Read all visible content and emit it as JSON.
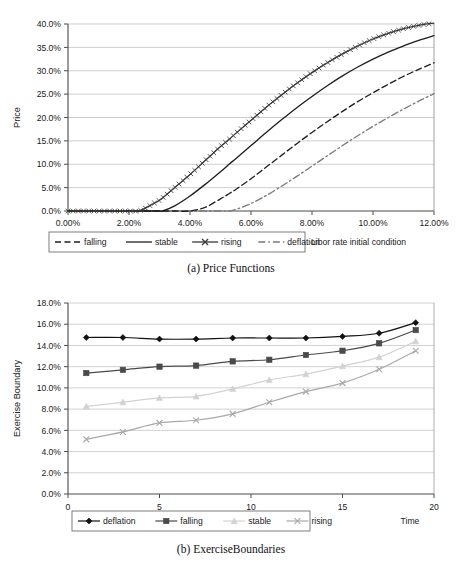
{
  "figures": [
    {
      "id": "price-functions",
      "caption": "(a) Price Functions",
      "outside_label": "Libor rate initial condition",
      "chart_data": {
        "type": "line",
        "title": "",
        "xlabel": "Libor rate initial condition",
        "ylabel": "Price",
        "xlim": [
          0,
          12
        ],
        "ylim": [
          0,
          40
        ],
        "xticks": [
          "0.00%",
          "2.00%",
          "4.00%",
          "6.00%",
          "8.00%",
          "10.00%",
          "12.00%"
        ],
        "xtick_values": [
          0,
          2,
          4,
          6,
          8,
          10,
          12
        ],
        "yticks": [
          "0.0%",
          "5.0%",
          "10.0%",
          "15.0%",
          "20.0%",
          "25.0%",
          "30.0%",
          "35.0%",
          "40.0%"
        ],
        "ytick_values": [
          0,
          5,
          10,
          15,
          20,
          25,
          30,
          35,
          40
        ],
        "grid": true,
        "legend_position": "bottom",
        "x": [
          0,
          0.5,
          1,
          1.5,
          2,
          2.3,
          2.5,
          3,
          3.1,
          3.5,
          4,
          4.5,
          5,
          5.3,
          5.5,
          6,
          6.5,
          7,
          7.5,
          8,
          8.5,
          9,
          9.5,
          10,
          10.5,
          11,
          11.5,
          12
        ],
        "series": [
          {
            "name": "rising",
            "style": "solid-x-markers",
            "color": "#3a3a3a",
            "values": [
              0,
              0,
              0,
              0,
              0,
              0,
              0.5,
              2.3,
              2.8,
              5.0,
              7.8,
              10.8,
              13.8,
              15.4,
              16.6,
              19.4,
              22.2,
              24.8,
              27.3,
              29.6,
              31.7,
              33.6,
              35.3,
              36.8,
              38.0,
              39.0,
              39.7,
              40.2
            ]
          },
          {
            "name": "stable",
            "style": "solid",
            "color": "#1f1f1f",
            "values": [
              0,
              0,
              0,
              0,
              0,
              0,
              0,
              0,
              0,
              1.1,
              3.2,
              5.7,
              8.4,
              10.1,
              11.2,
              14.0,
              16.8,
              19.5,
              22.1,
              24.5,
              26.8,
              28.9,
              30.8,
              32.5,
              34.0,
              35.3,
              36.5,
              37.5
            ]
          },
          {
            "name": "falling",
            "style": "dashed",
            "color": "#1f1f1f",
            "values": [
              0,
              0,
              0,
              0,
              0,
              0,
              0,
              0,
              0,
              0,
              0,
              0.8,
              2.6,
              3.8,
              4.6,
              6.9,
              9.4,
              11.9,
              14.4,
              16.8,
              19.1,
              21.3,
              23.4,
              25.3,
              27.1,
              28.8,
              30.3,
              31.7
            ]
          },
          {
            "name": "deflation",
            "style": "dash-dot",
            "color": "#7a7a7a",
            "values": [
              0,
              0,
              0,
              0,
              0,
              0,
              0,
              0,
              0,
              0,
              0,
              0,
              0,
              0,
              0.3,
              1.6,
              3.3,
              5.3,
              7.4,
              9.6,
              11.8,
              14.0,
              16.1,
              18.1,
              20.0,
              21.8,
              23.5,
              25.1
            ]
          }
        ],
        "legend": [
          {
            "label": "falling",
            "style": "dashed",
            "color": "#1f1f1f"
          },
          {
            "label": "stable",
            "style": "solid",
            "color": "#1f1f1f"
          },
          {
            "label": "rising",
            "style": "solid-x-markers",
            "color": "#3a3a3a"
          },
          {
            "label": "deflation",
            "style": "dash-dot",
            "color": "#7a7a7a"
          }
        ]
      }
    },
    {
      "id": "exercise-boundaries",
      "caption": "(b) ExerciseBoundaries",
      "outside_label": "Time",
      "chart_data": {
        "type": "line",
        "title": "",
        "xlabel": "Time",
        "ylabel": "Exercise Boundary",
        "xlim": [
          0,
          20
        ],
        "ylim": [
          0,
          18
        ],
        "xticks": [
          "0",
          "5",
          "10",
          "15",
          "20"
        ],
        "xtick_values": [
          0,
          5,
          10,
          15,
          20
        ],
        "yticks": [
          "0.0%",
          "2.0%",
          "4.0%",
          "6.0%",
          "8.0%",
          "10.0%",
          "12.0%",
          "14.0%",
          "16.0%",
          "18.0%"
        ],
        "ytick_values": [
          0,
          2,
          4,
          6,
          8,
          10,
          12,
          14,
          16,
          18
        ],
        "grid": true,
        "legend_position": "bottom",
        "x": [
          1,
          3,
          5,
          7,
          9,
          11,
          13,
          15,
          17,
          19
        ],
        "series": [
          {
            "name": "deflation",
            "marker": "diamond",
            "color": "#111111",
            "values": [
              14.75,
              14.75,
              14.6,
              14.6,
              14.7,
              14.7,
              14.7,
              14.85,
              15.15,
              16.15
            ]
          },
          {
            "name": "falling",
            "marker": "square",
            "color": "#4a4a4a",
            "values": [
              11.4,
              11.7,
              12.0,
              12.1,
              12.5,
              12.65,
              13.1,
              13.5,
              14.2,
              15.45
            ]
          },
          {
            "name": "stable",
            "marker": "triangle",
            "color": "#d2d2d2",
            "values": [
              8.25,
              8.65,
              9.05,
              9.2,
              9.9,
              10.75,
              11.3,
              12.05,
              12.9,
              14.4
            ]
          },
          {
            "name": "rising",
            "marker": "x",
            "color": "#a8a8a8",
            "values": [
              5.15,
              5.85,
              6.7,
              6.95,
              7.55,
              8.65,
              9.65,
              10.45,
              11.75,
              13.5
            ]
          }
        ],
        "legend": [
          {
            "label": "deflation",
            "marker": "diamond",
            "color": "#111111"
          },
          {
            "label": "falling",
            "marker": "square",
            "color": "#4a4a4a"
          },
          {
            "label": "stable",
            "marker": "triangle",
            "color": "#d2d2d2"
          },
          {
            "label": "rising",
            "marker": "x",
            "color": "#a8a8a8"
          }
        ]
      }
    }
  ]
}
